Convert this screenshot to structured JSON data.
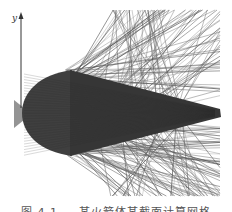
{
  "figure": {
    "type": "computational-mesh-visualization",
    "axis_label": "y",
    "colors": {
      "mesh_dark": "#3a3a3a",
      "mesh_mid": "#555555",
      "ray_line": "#777777",
      "axis": "#333333"
    }
  },
  "caption": "图 4.1 — 某火箭体某截面计算网格"
}
